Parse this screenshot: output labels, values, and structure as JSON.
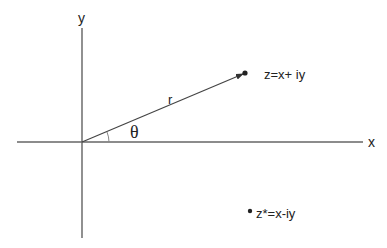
{
  "diagram": {
    "axes": {
      "x_label": "x",
      "y_label": "y",
      "color": "#555555"
    },
    "vector": {
      "label": "r",
      "color": "#444444"
    },
    "angle": {
      "label": "θ"
    },
    "points": [
      {
        "name": "z",
        "label": "z=x+ iy"
      },
      {
        "name": "z-conjugate",
        "label": "z*=x-iy"
      }
    ]
  }
}
